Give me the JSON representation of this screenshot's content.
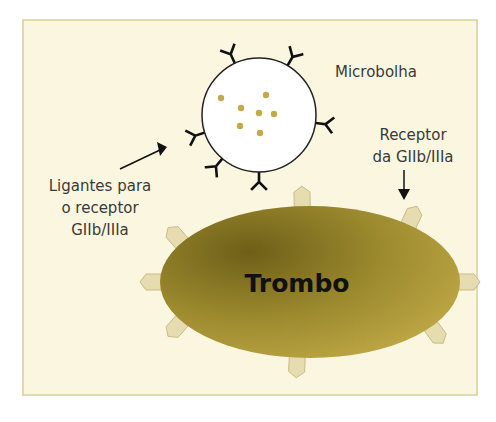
{
  "diagram": {
    "labels": {
      "microbubble": "Microbolha",
      "receptor_line1": "Receptor",
      "receptor_line2": "da GIIb/IIIa",
      "ligands_line1": "Ligantes para",
      "ligands_line2": "o receptor",
      "ligands_line3": "GIIb/IIIa",
      "thrombus": "Trombo"
    },
    "colors": {
      "background": "#fbf6e0",
      "frame": "#d8d09a",
      "thrombus_dark": "#7a6b1c",
      "thrombus_light": "#b9a23e",
      "receptor_fill": "#e6dcb0",
      "receptor_stroke": "#c8bb85",
      "microbubble_fill": "#ffffff",
      "particle": "#c4a94a",
      "ligand": "#111111"
    },
    "microbubble_particle_count": 7,
    "ligand_count": 7,
    "receptor_count": 8
  }
}
